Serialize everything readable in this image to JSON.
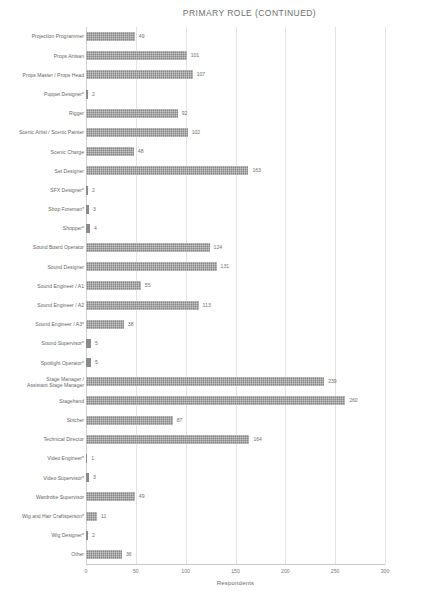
{
  "chart_data": {
    "type": "bar",
    "orientation": "horizontal",
    "title": "PRIMARY ROLE (CONTINUED)",
    "xlabel": "Respondents",
    "ylabel": "",
    "xlim": [
      0,
      300
    ],
    "xticks": [
      0,
      50,
      100,
      150,
      200,
      250,
      300
    ],
    "grid": true,
    "legend": false,
    "bar_color": "#858585",
    "categories": [
      "Projection Programmer",
      "Props Artisan",
      "Props Master / Props Head",
      "Puppet Designer*",
      "Rigger",
      "Scenic Artist / Scenic Painter",
      "Scenic Charge",
      "Set Designer",
      "SFX Designer*",
      "Shop Foreman*",
      "Shopper*",
      "Sound Board Operator",
      "Sound Designer",
      "Sound Engineer / A1",
      "Sound Engineer / A2",
      "Sound Engineer / A3*",
      "Sound Supervisor*",
      "Spotlight Operator*",
      "Stage Manager /\nAssistant Stage Manager",
      "Stagehand",
      "Stitcher",
      "Technical Director",
      "Video Engineer*",
      "Video Supervisor*",
      "Wardrobe Supervisor",
      "Wig and Hair Craftsperson*",
      "Wig Designer*",
      "Other"
    ],
    "values": [
      49,
      101,
      107,
      2,
      92,
      102,
      48,
      163,
      2,
      3,
      4,
      124,
      131,
      55,
      113,
      38,
      5,
      5,
      239,
      260,
      87,
      164,
      1,
      3,
      49,
      11,
      2,
      36
    ]
  }
}
